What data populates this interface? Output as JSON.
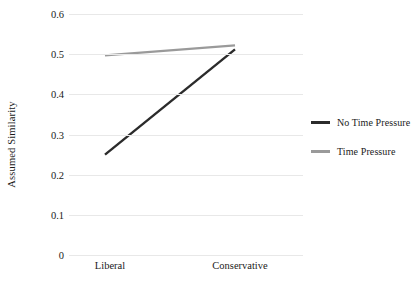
{
  "chart_data": {
    "type": "line",
    "title": "",
    "xlabel": "",
    "ylabel": "Assumed Similarity",
    "categories": [
      "Liberal",
      "Conservative"
    ],
    "ylim": [
      0,
      0.6
    ],
    "yticks": [
      "0",
      "0.1",
      "0.2",
      "0.3",
      "0.4",
      "0.5",
      "0.6"
    ],
    "ytick_values": [
      0,
      0.1,
      0.2,
      0.3,
      0.4,
      0.5,
      0.6
    ],
    "grid": "horizontal",
    "legend_position": "right",
    "series": [
      {
        "name": "No Time Pressure",
        "values": [
          0.25,
          0.512
        ],
        "color": "#2b2b2b"
      },
      {
        "name": "Time Pressure",
        "values": [
          0.497,
          0.522
        ],
        "color": "#9a9a9a"
      }
    ]
  },
  "axis": {
    "y_title": "Assumed Similarity"
  },
  "colors": {
    "gridline": "#e8e8e8",
    "text": "#1a1a1a",
    "background": "#ffffff"
  }
}
